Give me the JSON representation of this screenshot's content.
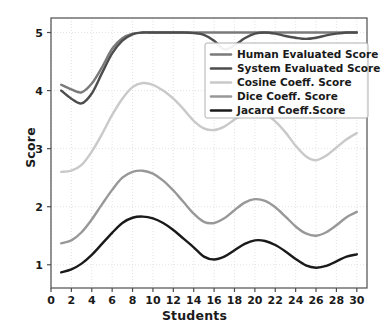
{
  "chart_data": {
    "type": "line",
    "title": "",
    "xlabel": "Students",
    "ylabel": "Score",
    "xlim": [
      0,
      31
    ],
    "ylim": [
      0.6,
      5.25
    ],
    "xticks": [
      0,
      2,
      4,
      6,
      8,
      10,
      12,
      14,
      16,
      18,
      20,
      22,
      24,
      26,
      28,
      30
    ],
    "yticks": [
      1,
      2,
      3,
      4,
      5
    ],
    "grid": true,
    "legend_position": "upper right",
    "x": [
      1,
      2,
      3,
      4,
      5,
      6,
      7,
      8,
      9,
      10,
      11,
      12,
      13,
      14,
      15,
      16,
      17,
      18,
      19,
      20,
      21,
      22,
      23,
      24,
      25,
      26,
      27,
      28,
      29,
      30
    ],
    "series": [
      {
        "name": "Human Evaluated Score",
        "color": "#7a7a7a",
        "values": [
          4.1,
          4.02,
          3.97,
          4.12,
          4.4,
          4.72,
          4.9,
          4.98,
          5.0,
          5.0,
          5.0,
          5.0,
          5.0,
          5.0,
          5.0,
          5.0,
          5.0,
          5.0,
          5.0,
          5.0,
          5.0,
          5.0,
          5.0,
          5.0,
          5.0,
          5.0,
          5.0,
          5.0,
          5.0,
          5.0
        ]
      },
      {
        "name": "System Evaluated Score",
        "color": "#4d4d4d",
        "values": [
          4.0,
          3.86,
          3.78,
          3.95,
          4.3,
          4.64,
          4.86,
          4.97,
          5.0,
          5.0,
          5.0,
          5.0,
          5.0,
          4.99,
          4.96,
          4.86,
          4.71,
          4.78,
          4.9,
          4.98,
          5.0,
          4.98,
          4.94,
          4.91,
          4.89,
          4.91,
          4.95,
          4.98,
          5.0,
          5.0
        ]
      },
      {
        "name": "Cosine Coeff. Score",
        "color": "#c9c9c9",
        "values": [
          2.6,
          2.62,
          2.72,
          2.95,
          3.25,
          3.58,
          3.86,
          4.06,
          4.13,
          4.1,
          4.0,
          3.86,
          3.68,
          3.48,
          3.35,
          3.32,
          3.38,
          3.5,
          3.6,
          3.64,
          3.6,
          3.47,
          3.28,
          3.05,
          2.87,
          2.8,
          2.88,
          3.02,
          3.16,
          3.27
        ]
      },
      {
        "name": "Dice Coeff. Score",
        "color": "#989898",
        "values": [
          1.37,
          1.42,
          1.56,
          1.78,
          2.04,
          2.29,
          2.5,
          2.6,
          2.62,
          2.57,
          2.45,
          2.28,
          2.08,
          1.88,
          1.74,
          1.72,
          1.8,
          1.94,
          2.07,
          2.13,
          2.1,
          1.99,
          1.83,
          1.66,
          1.54,
          1.5,
          1.56,
          1.68,
          1.82,
          1.91
        ]
      },
      {
        "name": "Jacard Coeff.Score",
        "color": "#1a1a1a",
        "values": [
          0.87,
          0.92,
          1.02,
          1.17,
          1.36,
          1.55,
          1.72,
          1.81,
          1.83,
          1.8,
          1.72,
          1.6,
          1.45,
          1.3,
          1.14,
          1.09,
          1.14,
          1.25,
          1.36,
          1.42,
          1.41,
          1.34,
          1.23,
          1.1,
          0.99,
          0.95,
          0.98,
          1.06,
          1.14,
          1.18
        ]
      }
    ]
  },
  "legend": {
    "items": [
      {
        "label": "Human Evaluated Score"
      },
      {
        "label": "System Evaluated Score"
      },
      {
        "label": "Cosine Coeff. Score"
      },
      {
        "label": "Dice Coeff. Score"
      },
      {
        "label": "Jacard Coeff.Score"
      }
    ]
  },
  "colors": {
    "axis": "#4d4d4d",
    "grid": "#dcdcdc",
    "background": "#ffffff",
    "legend_border": "#b0b0b0",
    "text": "#1a1a1a"
  }
}
